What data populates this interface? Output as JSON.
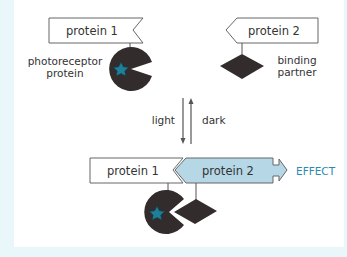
{
  "diagram": {
    "top_left": {
      "protein_label": "protein 1",
      "side_label_line1": "photoreceptor",
      "side_label_line2": "protein"
    },
    "top_right": {
      "protein_label": "protein 2",
      "side_label_line1": "binding",
      "side_label_line2": "partner"
    },
    "transition": {
      "forward_label": "light",
      "reverse_label": "dark"
    },
    "bottom": {
      "protein1_label": "protein 1",
      "protein2_label": "protein 2",
      "effect_label": "EFFECT"
    },
    "colors": {
      "background_border": "#eaf7fa",
      "panel": "#ffffff",
      "dark_shape": "#332c2c",
      "chromophore": "#1f7f99",
      "protein2_active_fill": "#b5d7e6",
      "effect_text": "#2a8ab0",
      "line": "#555555"
    }
  }
}
